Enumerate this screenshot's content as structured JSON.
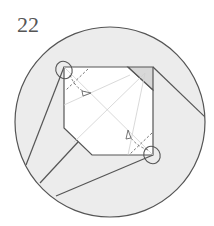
{
  "diagram": {
    "step_number": "22",
    "type": "origami-folding-step",
    "colors": {
      "background": "#ffffff",
      "circle_fill": "#ededed",
      "paper_front": "#ffffff",
      "paper_back": "#dcdcdc",
      "edge": "#555555",
      "crease": "#c8c8c8",
      "valley_fold": "#666666"
    },
    "elements": [
      {
        "name": "magnifier-circle",
        "description": "circular detail view"
      },
      {
        "name": "paper-square",
        "description": "white square with two chamfered corners"
      },
      {
        "name": "valley-fold-top-left",
        "description": "dashed valley fold with arrow at top-left corner"
      },
      {
        "name": "valley-fold-bottom-right",
        "description": "dashed valley fold with arrow at bottom-right corner"
      },
      {
        "name": "highlight-circle-top-left",
        "description": "circle marking top-left corner"
      },
      {
        "name": "highlight-circle-bottom-right",
        "description": "circle marking bottom-right corner"
      }
    ]
  }
}
